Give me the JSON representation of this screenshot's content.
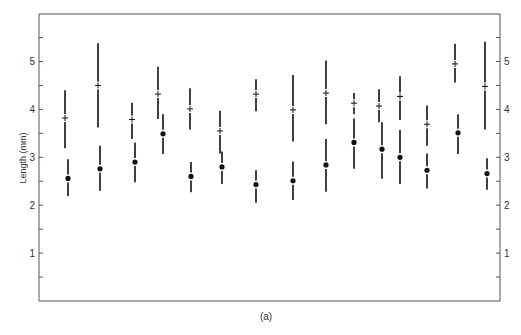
{
  "chart_data": {
    "type": "scatter",
    "title": "",
    "caption": "(a)",
    "xlabel": "",
    "ylabel": "Length (mm)",
    "ylim": [
      0,
      5.9
    ],
    "yticks_major": [
      1,
      2,
      3,
      4,
      5
    ],
    "yticks_minor": [
      0.5,
      1.5,
      2.5,
      3.5,
      4.5,
      5.5
    ],
    "right_axis_ticks": true,
    "grid": false,
    "legend": null,
    "series": [
      {
        "name": "plus",
        "marker": "+",
        "points": [
          {
            "i": 1,
            "y": 3.82,
            "lo": 3.19,
            "hi": 4.4
          },
          {
            "i": 2,
            "y": 4.5,
            "lo": 3.62,
            "hi": 5.38
          },
          {
            "i": 3,
            "y": 3.79,
            "lo": 3.38,
            "hi": 4.14
          },
          {
            "i": 4,
            "y": 4.32,
            "lo": 3.8,
            "hi": 4.89
          },
          {
            "i": 5,
            "y": 4.01,
            "lo": 3.58,
            "hi": 4.44
          },
          {
            "i": 6,
            "y": 3.55,
            "lo": 3.08,
            "hi": 3.97
          },
          {
            "i": 7,
            "y": 4.32,
            "lo": 3.96,
            "hi": 4.63
          },
          {
            "i": 8,
            "y": 3.99,
            "lo": 3.33,
            "hi": 4.72
          },
          {
            "i": 9,
            "y": 4.34,
            "lo": 3.69,
            "hi": 5.02
          },
          {
            "i": 10,
            "y": 4.13,
            "lo": 3.9,
            "hi": 4.34
          },
          {
            "i": 11,
            "y": 4.07,
            "lo": 3.73,
            "hi": 4.42
          },
          {
            "i": 12,
            "y": 4.27,
            "lo": 3.78,
            "hi": 4.69
          },
          {
            "i": 13,
            "y": 3.69,
            "lo": 3.24,
            "hi": 4.08
          },
          {
            "i": 14,
            "y": 4.95,
            "lo": 4.56,
            "hi": 5.37
          },
          {
            "i": 15,
            "y": 4.48,
            "lo": 3.58,
            "hi": 5.41
          }
        ]
      },
      {
        "name": "dot",
        "marker": "filled-circle",
        "points": [
          {
            "i": 1,
            "y": 2.56,
            "lo": 2.19,
            "hi": 2.96
          },
          {
            "i": 2,
            "y": 2.76,
            "lo": 2.3,
            "hi": 3.24
          },
          {
            "i": 3,
            "y": 2.9,
            "lo": 2.48,
            "hi": 3.31
          },
          {
            "i": 4,
            "y": 3.49,
            "lo": 3.07,
            "hi": 3.9
          },
          {
            "i": 5,
            "y": 2.6,
            "lo": 2.27,
            "hi": 2.9
          },
          {
            "i": 6,
            "y": 2.8,
            "lo": 2.44,
            "hi": 3.12
          },
          {
            "i": 7,
            "y": 2.43,
            "lo": 2.05,
            "hi": 2.73
          },
          {
            "i": 8,
            "y": 2.51,
            "lo": 2.11,
            "hi": 2.91
          },
          {
            "i": 9,
            "y": 2.84,
            "lo": 2.28,
            "hi": 3.38
          },
          {
            "i": 10,
            "y": 3.31,
            "lo": 2.76,
            "hi": 3.81
          },
          {
            "i": 11,
            "y": 3.17,
            "lo": 2.55,
            "hi": 3.73
          },
          {
            "i": 12,
            "y": 3.0,
            "lo": 2.44,
            "hi": 3.57
          },
          {
            "i": 13,
            "y": 2.73,
            "lo": 2.35,
            "hi": 3.08
          },
          {
            "i": 14,
            "y": 3.51,
            "lo": 3.07,
            "hi": 3.9
          },
          {
            "i": 15,
            "y": 2.66,
            "lo": 2.32,
            "hi": 2.98
          }
        ]
      }
    ],
    "x_positions_px": {
      "plus": [
        65,
        98,
        132,
        158,
        190,
        220,
        256,
        293,
        326,
        354,
        379,
        400,
        427,
        455,
        485
      ],
      "dot": [
        68,
        100,
        135,
        163,
        191,
        222,
        256,
        293,
        326,
        354,
        382,
        400,
        427,
        458,
        487
      ]
    }
  },
  "colors": {
    "axis": "#555555",
    "marks": "#111111",
    "text": "#333333"
  }
}
